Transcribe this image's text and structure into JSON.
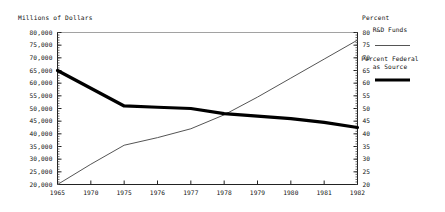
{
  "chart_data": {
    "type": "line",
    "title": "",
    "ylabel": "Millions of Dollars",
    "ylabel_right": "Percent",
    "xlabel": "",
    "grid": false,
    "legend_position": "right",
    "x": [
      "1965",
      "1970",
      "1975",
      "1976",
      "1977",
      "1978",
      "1979",
      "1980",
      "1981",
      "1982"
    ],
    "xlim": [
      0,
      9
    ],
    "ylim": [
      20000,
      80000
    ],
    "ylim_right": [
      20,
      80
    ],
    "ytick_labels": [
      "80,000",
      "75,000",
      "70,000",
      "65,000",
      "60,000",
      "55,000",
      "50,000",
      "45,000",
      "40,000",
      "35,000",
      "30,000",
      "25,000",
      "20,000"
    ],
    "ytick_values": [
      80000,
      75000,
      70000,
      65000,
      60000,
      55000,
      50000,
      45000,
      40000,
      35000,
      30000,
      25000,
      20000
    ],
    "ytick_labels_right": [
      "80",
      "75",
      "70",
      "65",
      "60",
      "55",
      "50",
      "45",
      "40",
      "35",
      "30",
      "25",
      "20"
    ],
    "ytick_values_right": [
      80,
      75,
      70,
      65,
      60,
      55,
      50,
      45,
      40,
      35,
      30,
      25,
      20
    ],
    "series": [
      {
        "name": "R&D Funds",
        "axis": "left",
        "style": "thin",
        "color": "#555555",
        "values": [
          20000,
          28000,
          35500,
          38500,
          42000,
          47500,
          54500,
          62000,
          69500,
          77000
        ]
      },
      {
        "name": "Percent Federal as Source",
        "axis": "right",
        "style": "thick",
        "color": "#000000",
        "values": [
          65,
          58,
          51,
          50.5,
          50,
          48,
          47,
          46,
          44.5,
          42.5
        ]
      }
    ]
  },
  "legend": {
    "entries": [
      {
        "label": "R&D Funds",
        "swatch": "thin-line-swatch"
      },
      {
        "label_line1": "Percent Federal",
        "label_line2": "as Source",
        "swatch": "thick-line-swatch"
      }
    ]
  },
  "labels": {
    "left_axis_title": "Millions of Dollars",
    "right_axis_title": "Percent",
    "legend_series_1": "R&D Funds",
    "legend_series_2_line1": "Percent Federal",
    "legend_series_2_line2": "as Source"
  },
  "colors": {
    "axis": "#222222",
    "thin_line": "#555555",
    "thick_line": "#000000",
    "background": "#ffffff",
    "text": "#111111"
  }
}
